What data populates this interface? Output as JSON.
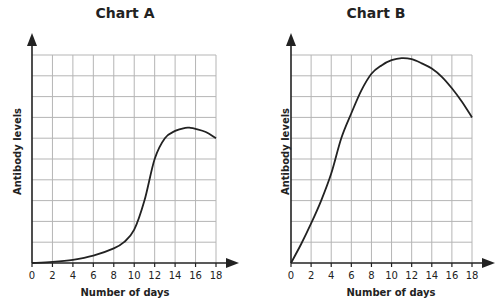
{
  "chart_data": [
    {
      "type": "line",
      "title": "Chart A",
      "xlabel": "Number of days",
      "ylabel": "Antibody levels",
      "x_ticks": [
        0,
        2,
        4,
        6,
        8,
        10,
        12,
        14,
        16,
        18
      ],
      "xlim": [
        0,
        18
      ],
      "ylim": [
        0,
        10
      ],
      "y_tick_labels": [],
      "grid": true,
      "x": [
        0,
        2,
        4,
        6,
        8,
        9,
        10,
        11,
        12,
        13,
        14,
        15,
        15.5,
        16,
        17,
        18
      ],
      "values": [
        0,
        0.05,
        0.15,
        0.35,
        0.7,
        1.0,
        1.6,
        3.0,
        5.0,
        6.0,
        6.35,
        6.5,
        6.5,
        6.45,
        6.3,
        6.0
      ]
    },
    {
      "type": "line",
      "title": "Chart B",
      "xlabel": "Number of days",
      "ylabel": "Antibody levels",
      "x_ticks": [
        0,
        2,
        4,
        6,
        8,
        10,
        12,
        14,
        16,
        18
      ],
      "xlim": [
        0,
        18
      ],
      "ylim": [
        0,
        10
      ],
      "y_tick_labels": [],
      "grid": true,
      "x": [
        0,
        1,
        2,
        3,
        4,
        5,
        6,
        7,
        8,
        9,
        10,
        11,
        12,
        13,
        14,
        15,
        16,
        17,
        18
      ],
      "values": [
        0,
        0.9,
        1.9,
        3.0,
        4.3,
        6.0,
        7.2,
        8.3,
        9.1,
        9.5,
        9.75,
        9.85,
        9.8,
        9.6,
        9.35,
        8.95,
        8.4,
        7.75,
        7.0
      ]
    }
  ],
  "charts": [
    {
      "title": "Chart A",
      "xlabel": "Number of days",
      "ylabel": "Antibody levels"
    },
    {
      "title": "Chart B",
      "xlabel": "Number of days",
      "ylabel": "Antibody levels"
    }
  ],
  "colors": {
    "grid": "#b5b5b5",
    "axis": "#222222",
    "curve": "#222222"
  }
}
